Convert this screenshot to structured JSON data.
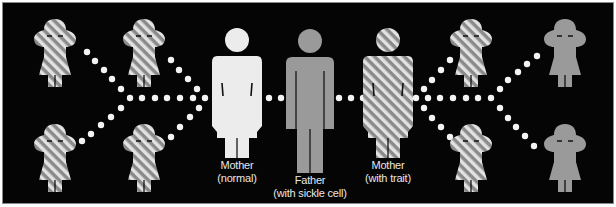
{
  "diagram": {
    "colors": {
      "background": "#050505",
      "normal": "#ececec",
      "sickle": "#9a9a9a",
      "trait_stripe_light": "#e0e0e0",
      "trait_stripe_dark": "#8a8a8a",
      "dots": "#f4f4f4"
    },
    "parents": [
      {
        "id": "mother-normal",
        "line1": "Mother",
        "line2": "(normal)",
        "status": "normal",
        "sex": "female"
      },
      {
        "id": "father-sickle",
        "line1": "Father",
        "line2": "(with sickle cell)",
        "status": "sickle",
        "sex": "male"
      },
      {
        "id": "mother-trait",
        "line1": "Mother",
        "line2": "(with trait)",
        "status": "trait",
        "sex": "female"
      }
    ],
    "children_left": [
      {
        "id": "child-left-1",
        "status": "trait"
      },
      {
        "id": "child-left-2",
        "status": "trait"
      },
      {
        "id": "child-left-3",
        "status": "trait"
      },
      {
        "id": "child-left-4",
        "status": "trait"
      }
    ],
    "children_right": [
      {
        "id": "child-right-1",
        "status": "trait"
      },
      {
        "id": "child-right-2",
        "status": "sickle"
      },
      {
        "id": "child-right-3",
        "status": "trait"
      },
      {
        "id": "child-right-4",
        "status": "sickle"
      }
    ]
  }
}
